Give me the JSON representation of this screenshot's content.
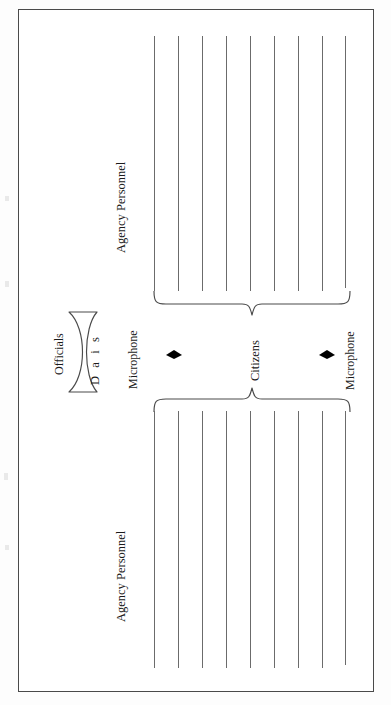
{
  "figure": {
    "orientation": "rotated-90",
    "background_color": "#ffffff",
    "frame_color": "#4a4a4a",
    "line_color": "#6b6b6b",
    "text_color": "#1b1b1b",
    "marker_color": "#000000"
  },
  "labels": {
    "officials": "Officials",
    "dais": "D a i s",
    "microphone_left": "Microphone",
    "microphone_right": "Microphone",
    "citizens": "Citizens",
    "agency_personnel_top": "Agency Personnel",
    "agency_personnel_bottom": "Agency Personnel"
  },
  "seating": {
    "top_block": {
      "label": "Agency Personnel",
      "row_count": 9,
      "rows": [
        1,
        2,
        3,
        4,
        5,
        6,
        7,
        8,
        9
      ]
    },
    "bottom_block": {
      "label": "Agency Personnel",
      "row_count": 9,
      "rows": [
        1,
        2,
        3,
        4,
        5,
        6,
        7,
        8,
        9
      ]
    }
  },
  "braces": {
    "top_brace_label": "Citizens",
    "bottom_brace_label": "Citizens"
  },
  "markers": {
    "microphone_count": 2,
    "microphone_glyph": "diamond"
  }
}
